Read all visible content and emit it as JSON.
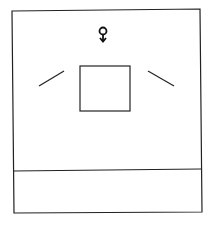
{
  "diagram": {
    "symbol": "circle-with-down-arrow",
    "stroke_color": "#222222",
    "background": "#ffffff"
  }
}
